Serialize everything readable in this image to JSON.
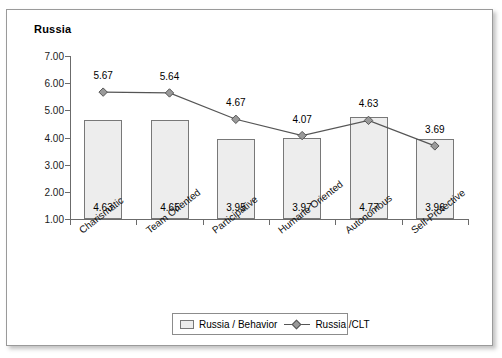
{
  "figure": {
    "title": "Russia"
  },
  "chart_data": {
    "type": "bar",
    "title": "Russia",
    "xlabel": "",
    "ylabel": "",
    "ylim": [
      1.0,
      7.0
    ],
    "y_ticks": [
      "1.00",
      "2.00",
      "3.00",
      "4.00",
      "5.00",
      "6.00",
      "7.00"
    ],
    "grid": false,
    "legend_position": "bottom",
    "categories": [
      "Charismatic",
      "Team Oriented",
      "Participative",
      "Humane Oriented",
      "Autonomous",
      "Self-Protective"
    ],
    "series": [
      {
        "name": "Russia / Behavior",
        "type": "bar",
        "values": [
          4.63,
          4.65,
          3.95,
          3.97,
          4.77,
          3.96
        ],
        "labels": [
          "4.63",
          "4.65",
          "3.95",
          "3.97",
          "4.77",
          "3.96"
        ],
        "color": "#ededed",
        "border_color": "#787878"
      },
      {
        "name": "Russia /CLT",
        "type": "line",
        "values": [
          5.67,
          5.64,
          4.67,
          4.07,
          4.63,
          3.69
        ],
        "labels": [
          "5.67",
          "5.64",
          "4.67",
          "4.07",
          "4.63",
          "3.69"
        ],
        "color": "#555555",
        "marker": "diamond",
        "marker_color": "#9a9a9a"
      }
    ]
  },
  "legend": {
    "items": [
      {
        "label": "Russia / Behavior",
        "icon": "square-swatch"
      },
      {
        "label": "Russia /CLT",
        "icon": "line-diamond-marker"
      }
    ]
  }
}
